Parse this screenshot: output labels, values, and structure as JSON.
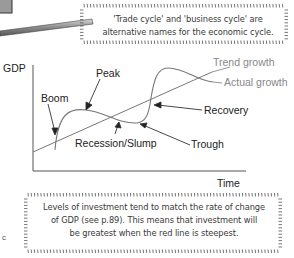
{
  "notes": {
    "top": "'Trade cycle' and 'business cycle' are alternative names for the economic cycle.",
    "top_line1": "'Trade cycle' and 'business cycle' are",
    "top_line2": "alternative names for the economic cycle.",
    "bottom_line1": "Levels of investment tend to match the rate of change",
    "bottom_line2": "of GDP (see p.89).  This means that investment will",
    "bottom_line3": "be greatest when the red line is steepest."
  },
  "stray_text": "c",
  "chart_data": {
    "type": "line",
    "title": "",
    "xlabel": "Time",
    "ylabel": "GDP",
    "grid": false,
    "series": [
      {
        "name": "Trend growth",
        "color": "#666666",
        "shape": "straight rising line"
      },
      {
        "name": "Actual growth",
        "color": "#666666",
        "shape": "oscillating curve around trend"
      }
    ],
    "annotations": [
      "Boom",
      "Peak",
      "Recession/Slump",
      "Trough",
      "Recovery"
    ],
    "legend": {
      "position": "right, inline labels",
      "entries": [
        "Trend growth",
        "Actual growth"
      ]
    }
  },
  "labels": {
    "gdp": "GDP",
    "time": "Time",
    "trend": "Trend growth",
    "actual": "Actual growth",
    "boom": "Boom",
    "peak": "Peak",
    "recession": "Recession/Slump",
    "trough": "Trough",
    "recovery": "Recovery"
  }
}
